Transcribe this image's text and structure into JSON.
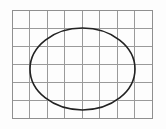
{
  "figure": {
    "canvas": {
      "width": 166,
      "height": 129,
      "background_color": "#fdfdfd"
    }
  },
  "chart_data": {
    "type": "scatter",
    "title": "",
    "subtitle": "",
    "xlabel": "",
    "ylabel": "",
    "grid": true,
    "legend": false,
    "legend_position": "none",
    "xlim": [
      0,
      8
    ],
    "ylim": [
      0,
      6
    ],
    "grid_spec": {
      "columns": 8,
      "rows": 6,
      "cell_width_px": 17.5,
      "cell_height_px": 18,
      "origin_x_px": 12,
      "origin_y_px": 10,
      "extent_x_px": 152,
      "extent_y_px": 118,
      "line_color": "#9a9a9a",
      "line_width_px": 1,
      "outer_border_color": "#8f8f8f"
    },
    "shapes": [
      {
        "name": "ellipse",
        "kind": "ellipse",
        "center_px": [
          82.5,
          69
        ],
        "center_grid": [
          4.03,
          3.28
        ],
        "radius_x_px": 52.5,
        "radius_y_px": 41,
        "radius_x_grid": 3.0,
        "radius_y_grid": 2.28,
        "stroke_color": "#222222",
        "stroke_width_px": 1.6,
        "fill": "none",
        "bounds_px": {
          "left": 30,
          "right": 135,
          "top": 28,
          "bottom": 110
        }
      }
    ],
    "annotations": [],
    "tick_labels": {
      "x": [],
      "y": []
    }
  }
}
